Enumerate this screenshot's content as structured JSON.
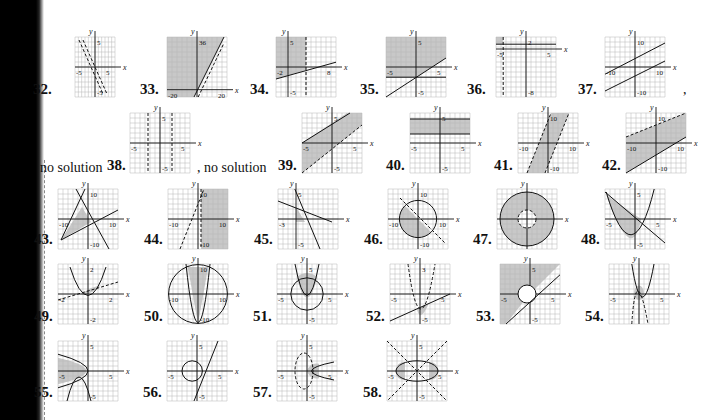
{
  "page": {
    "type": "textbook answer key",
    "section": "graphs of systems of inequalities",
    "colors": {
      "shade": "#c8c8c8",
      "grid": "#b5b5b5",
      "ink": "#111111",
      "binding": "#000000"
    }
  },
  "notes": [
    {
      "text": "no solution",
      "x": 40,
      "y": 160
    },
    {
      "text": ", no solution",
      "x": 197,
      "y": 160
    },
    {
      "text": ",",
      "x": 683,
      "y": 82
    }
  ],
  "graphs": [
    {
      "n": "32.",
      "x": 75,
      "y": 37,
      "w": 40,
      "h": 60,
      "nx": -5,
      "px": 5,
      "ny": -5,
      "py": 5,
      "xlabels": [
        "-5",
        "5"
      ],
      "ylabels": [
        "5",
        "-5"
      ],
      "shapes": "lines-steep-neg",
      "nl": [
        33,
        95
      ]
    },
    {
      "n": "33.",
      "x": 167,
      "y": 37,
      "w": 60,
      "h": 60,
      "nx": -20,
      "px": 20,
      "ny": -5,
      "py": 36,
      "xlabels": [
        "-20",
        "20"
      ],
      "ylabels": [
        "36"
      ],
      "shapes": "shade-left-of-line",
      "nl": [
        140,
        95
      ]
    },
    {
      "n": "34.",
      "x": 276,
      "y": 37,
      "w": 60,
      "h": 60,
      "nx": -2,
      "px": 8,
      "ny": -5,
      "py": 5,
      "xlabels": [
        "-2",
        "8"
      ],
      "ylabels": [
        "5",
        "-5"
      ],
      "shapes": "shade-above-line-vdash",
      "nl": [
        250,
        95
      ]
    },
    {
      "n": "35.",
      "x": 386,
      "y": 37,
      "w": 60,
      "h": 60,
      "nx": -5,
      "px": 5,
      "ny": -5,
      "py": 5,
      "xlabels": [
        "-5",
        "5"
      ],
      "ylabels": [
        "5",
        "-5"
      ],
      "shapes": "shade-above-two-lines",
      "nl": [
        360,
        95
      ]
    },
    {
      "n": "36.",
      "x": 496,
      "y": 37,
      "w": 60,
      "h": 60,
      "nx": -5,
      "px": 5,
      "ny": -8,
      "py": 2,
      "xlabels": [
        "-5",
        "5"
      ],
      "ylabels": [
        "2",
        "-8"
      ],
      "shapes": "small-corner",
      "nl": [
        467,
        95
      ]
    },
    {
      "n": "37.",
      "x": 605,
      "y": 37,
      "w": 60,
      "h": 60,
      "nx": -10,
      "px": 10,
      "ny": -10,
      "py": 10,
      "xlabels": [
        "-10",
        "10"
      ],
      "ylabels": [
        "10",
        "-10"
      ],
      "shapes": "parallel-lines",
      "nl": [
        578,
        95
      ]
    },
    {
      "n": "38.",
      "x": 130,
      "y": 113,
      "w": 60,
      "h": 60,
      "nx": -5,
      "px": 5,
      "ny": -5,
      "py": 5,
      "xlabels": [
        "-5",
        "5"
      ],
      "ylabels": [
        "5",
        "-5"
      ],
      "shapes": "two-vdash",
      "nl": [
        107,
        171
      ]
    },
    {
      "n": "39.",
      "x": 302,
      "y": 113,
      "w": 60,
      "h": 60,
      "nx": -5,
      "px": 5,
      "ny": -5,
      "py": 5,
      "xlabels": [
        "-5",
        "5"
      ],
      "ylabels": [
        "5",
        "-5"
      ],
      "shapes": "band-diag",
      "nl": [
        278,
        171
      ]
    },
    {
      "n": "40.",
      "x": 410,
      "y": 113,
      "w": 60,
      "h": 60,
      "nx": -5,
      "px": 5,
      "ny": -5,
      "py": 5,
      "xlabels": [
        "-5",
        "5"
      ],
      "ylabels": [
        "5",
        "-5"
      ],
      "shapes": "band-horiz",
      "nl": [
        386,
        171
      ]
    },
    {
      "n": "41.",
      "x": 518,
      "y": 113,
      "w": 60,
      "h": 60,
      "nx": -10,
      "px": 10,
      "ny": -10,
      "py": 10,
      "xlabels": [
        "-10",
        "10"
      ],
      "ylabels": [
        "10",
        "-10"
      ],
      "shapes": "band-steep",
      "nl": [
        494,
        171
      ]
    },
    {
      "n": "42.",
      "x": 626,
      "y": 113,
      "w": 60,
      "h": 60,
      "nx": -10,
      "px": 10,
      "ny": -10,
      "py": 10,
      "xlabels": [
        "-10",
        "10"
      ],
      "ylabels": [
        "10",
        "-10"
      ],
      "shapes": "band-diag-wide",
      "nl": [
        602,
        171
      ]
    },
    {
      "n": "43.",
      "x": 58,
      "y": 189,
      "w": 60,
      "h": 60,
      "nx": -10,
      "px": 10,
      "ny": -10,
      "py": 10,
      "xlabels": [
        "-10",
        "10"
      ],
      "ylabels": [
        "10",
        "-10"
      ],
      "shapes": "triangle",
      "nl": [
        34,
        245
      ]
    },
    {
      "n": "44.",
      "x": 168,
      "y": 189,
      "w": 60,
      "h": 60,
      "nx": -10,
      "px": 10,
      "ny": -10,
      "py": 10,
      "xlabels": [
        "-10",
        "10"
      ],
      "ylabels": [
        "10",
        "-10"
      ],
      "shapes": "shade-right",
      "nl": [
        144,
        245
      ]
    },
    {
      "n": "45.",
      "x": 278,
      "y": 189,
      "w": 60,
      "h": 60,
      "nx": -3,
      "px": 7,
      "ny": -5,
      "py": 5,
      "xlabels": [
        "-3"
      ],
      "ylabels": [
        "5",
        "-5"
      ],
      "shapes": "small-triangle",
      "nl": [
        254,
        245
      ]
    },
    {
      "n": "46.",
      "x": 388,
      "y": 189,
      "w": 60,
      "h": 60,
      "nx": -10,
      "px": 10,
      "ny": -10,
      "py": 10,
      "xlabels": [
        "-10",
        "10"
      ],
      "ylabels": [
        "10",
        "-10"
      ],
      "shapes": "circle-half",
      "nl": [
        364,
        245
      ]
    },
    {
      "n": "47.",
      "x": 497,
      "y": 189,
      "w": 60,
      "h": 60,
      "nx": -5,
      "px": 5,
      "ny": -5,
      "py": 5,
      "xlabels": [],
      "ylabels": [],
      "shapes": "annulus",
      "nl": [
        473,
        245
      ]
    },
    {
      "n": "48.",
      "x": 605,
      "y": 189,
      "w": 60,
      "h": 60,
      "nx": -5,
      "px": 5,
      "ny": -5,
      "py": 5,
      "xlabels": [
        "-5",
        "5"
      ],
      "ylabels": [
        "5",
        "-5"
      ],
      "shapes": "parabola-line",
      "nl": [
        581,
        245
      ]
    },
    {
      "n": "49.",
      "x": 58,
      "y": 264,
      "w": 60,
      "h": 60,
      "nx": -3,
      "px": 3,
      "ny": -3,
      "py": 3,
      "xlabels": [
        "-2",
        "2"
      ],
      "ylabels": [
        "2",
        "-2"
      ],
      "shapes": "parabola-dashline",
      "nl": [
        34,
        322
      ]
    },
    {
      "n": "50.",
      "x": 168,
      "y": 264,
      "w": 60,
      "h": 60,
      "nx": -10,
      "px": 10,
      "ny": -10,
      "py": 10,
      "xlabels": [
        "-10",
        "10"
      ],
      "ylabels": [
        "10",
        "-10"
      ],
      "shapes": "circle-parabola",
      "nl": [
        144,
        322
      ]
    },
    {
      "n": "51.",
      "x": 277,
      "y": 264,
      "w": 60,
      "h": 60,
      "nx": -5,
      "px": 5,
      "ny": -5,
      "py": 5,
      "xlabels": [
        "-5",
        "5"
      ],
      "ylabels": [
        "5",
        "-5"
      ],
      "shapes": "circle-parabola-small",
      "nl": [
        253,
        322
      ]
    },
    {
      "n": "52.",
      "x": 390,
      "y": 264,
      "w": 60,
      "h": 60,
      "nx": -5,
      "px": 5,
      "ny": -5,
      "py": 5,
      "xlabels": [
        "-5",
        "5"
      ],
      "ylabels": [
        "3",
        "-5"
      ],
      "shapes": "dash-parabola-line",
      "nl": [
        366,
        322
      ]
    },
    {
      "n": "53.",
      "x": 500,
      "y": 264,
      "w": 60,
      "h": 60,
      "nx": -5,
      "px": 5,
      "ny": -5,
      "py": 5,
      "xlabels": [
        "-5",
        "5"
      ],
      "ylabels": [
        "5",
        "-5"
      ],
      "shapes": "shade-circle-line",
      "nl": [
        476,
        322
      ]
    },
    {
      "n": "54.",
      "x": 609,
      "y": 264,
      "w": 60,
      "h": 60,
      "nx": -5,
      "px": 5,
      "ny": -5,
      "py": 5,
      "xlabels": [
        "-5",
        "5"
      ],
      "ylabels": [],
      "shapes": "two-parabolas",
      "nl": [
        585,
        322
      ]
    },
    {
      "n": "55.",
      "x": 58,
      "y": 341,
      "w": 60,
      "h": 60,
      "nx": -5,
      "px": 5,
      "ny": -5,
      "py": 5,
      "xlabels": [
        "-5",
        "5"
      ],
      "ylabels": [
        "5",
        "-5"
      ],
      "shapes": "sideways-parabola",
      "nl": [
        34,
        398
      ]
    },
    {
      "n": "56.",
      "x": 167,
      "y": 341,
      "w": 60,
      "h": 60,
      "nx": -5,
      "px": 5,
      "ny": -5,
      "py": 5,
      "xlabels": [
        "-5",
        "5"
      ],
      "ylabels": [
        "5",
        "-5"
      ],
      "shapes": "circle-tangent",
      "nl": [
        143,
        398
      ]
    },
    {
      "n": "57.",
      "x": 277,
      "y": 341,
      "w": 60,
      "h": 60,
      "nx": -5,
      "px": 5,
      "ny": -5,
      "py": 5,
      "xlabels": [
        "-5",
        "5"
      ],
      "ylabels": [
        "5",
        "-5"
      ],
      "shapes": "ellipse-dash-parabola",
      "nl": [
        253,
        398
      ]
    },
    {
      "n": "58.",
      "x": 387,
      "y": 341,
      "w": 60,
      "h": 60,
      "nx": -5,
      "px": 5,
      "ny": -5,
      "py": 5,
      "xlabels": [
        "-5",
        "5"
      ],
      "ylabels": [
        "5",
        "-5"
      ],
      "shapes": "ellipse-hyperbola",
      "nl": [
        363,
        398
      ]
    }
  ]
}
